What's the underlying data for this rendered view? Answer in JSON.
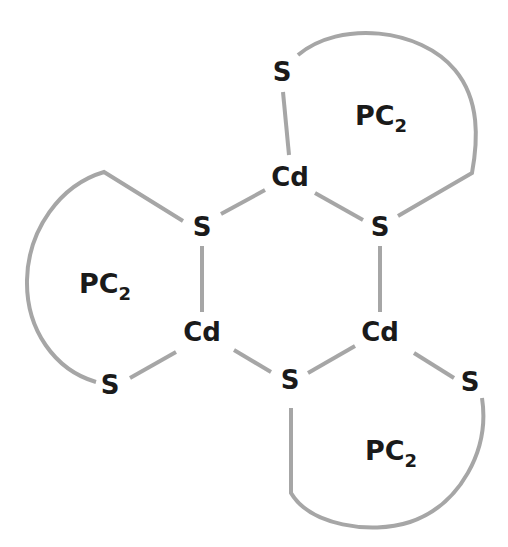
{
  "diagram": {
    "title": "",
    "bond_color": "#a6a6a6",
    "text_color": "#1a1a1a",
    "atoms": [
      {
        "id": "cd_top",
        "label": "Cd",
        "x": 290,
        "y": 177
      },
      {
        "id": "cd_left",
        "label": "Cd",
        "x": 202,
        "y": 332
      },
      {
        "id": "cd_right",
        "label": "Cd",
        "x": 380,
        "y": 332
      },
      {
        "id": "s_ring_left",
        "label": "S",
        "x": 202,
        "y": 227
      },
      {
        "id": "s_ring_right",
        "label": "S",
        "x": 380,
        "y": 227
      },
      {
        "id": "s_ring_bottom",
        "label": "S",
        "x": 290,
        "y": 380
      },
      {
        "id": "s_top",
        "label": "S",
        "x": 282,
        "y": 72
      },
      {
        "id": "s_bottom_left",
        "label": "S",
        "x": 110,
        "y": 385
      },
      {
        "id": "s_bottom_right",
        "label": "S",
        "x": 470,
        "y": 382
      }
    ],
    "ligands": [
      {
        "id": "pc2_top",
        "label": "PC",
        "subscript": "2",
        "x": 383,
        "y": 115
      },
      {
        "id": "pc2_left",
        "label": "PC",
        "subscript": "2",
        "x": 107,
        "y": 283
      },
      {
        "id": "pc2_bottom",
        "label": "PC",
        "subscript": "2",
        "x": 393,
        "y": 452
      }
    ]
  }
}
